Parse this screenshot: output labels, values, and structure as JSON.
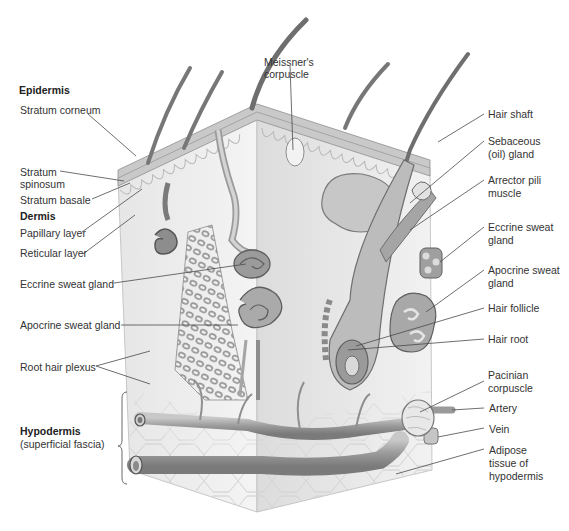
{
  "diagram": {
    "left_labels": {
      "epidermis_heading": "Epidermis",
      "stratum_corneum": "Stratum corneum",
      "stratum_spinosum_1": "Stratum",
      "stratum_spinosum_2": "spinosum",
      "stratum_basale": "Stratum basale",
      "dermis_heading": "Dermis",
      "papillary_layer": "Papillary layer",
      "reticular_layer": "Reticular layer",
      "eccrine_sweat_gland": "Eccrine sweat gland",
      "apocrine_sweat_gland": "Apocrine sweat gland",
      "root_hair_plexus": "Root hair plexus",
      "hypodermis_heading": "Hypodermis",
      "hypodermis_sub": "(superficial fascia)"
    },
    "top_labels": {
      "meissner_1": "Meissner's",
      "meissner_2": "corpuscle"
    },
    "right_labels": {
      "hair_shaft": "Hair shaft",
      "sebaceous_1": "Sebaceous",
      "sebaceous_2": "(oil) gland",
      "arrector_1": "Arrector pili",
      "arrector_2": "muscle",
      "eccrine_1": "Eccrine sweat",
      "eccrine_2": "gland",
      "apocrine_1": "Apocrine sweat",
      "apocrine_2": "gland",
      "hair_follicle": "Hair follicle",
      "hair_root": "Hair root",
      "pacinian_1": "Pacinian",
      "pacinian_2": "corpuscle",
      "artery": "Artery",
      "vein": "Vein",
      "adipose_1": "Adipose",
      "adipose_2": "tissue of",
      "adipose_3": "hypodermis"
    },
    "colors": {
      "leader_line": "#4a4a4a",
      "tissue_light": "#eeeeee",
      "tissue_mid": "#bdbdbd",
      "tissue_dark": "#7d7d7d",
      "epidermis_band": "#c8c8c8"
    }
  }
}
